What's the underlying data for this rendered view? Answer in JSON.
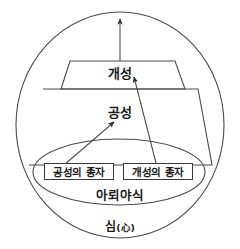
{
  "diagram": {
    "type": "concept-diagram",
    "outer_circle": {
      "name": "mind-circle",
      "label": "심(心)",
      "label_korean": "심",
      "label_hanja": "心"
    },
    "inner_ellipse": {
      "name": "alaya-consciousness-ellipse",
      "label": "아뢰야식"
    },
    "layers": [
      {
        "name": "upper-trapezoid",
        "label": "개성"
      },
      {
        "name": "lower-trapezoid",
        "label": "공성"
      }
    ],
    "seed_boxes": [
      {
        "name": "seed-box-gongseong",
        "label": "공성의 종자"
      },
      {
        "name": "seed-box-gaeseong",
        "label": "개성의 종자"
      }
    ],
    "arrows": [
      {
        "name": "arrow-seed-to-gongseong",
        "from": "공성의 종자",
        "to": "공성"
      },
      {
        "name": "arrow-seed-to-gaeseong",
        "from": "개성의 종자",
        "to": "개성"
      },
      {
        "name": "arrow-upward-outflow",
        "from": "개성",
        "to": ""
      }
    ],
    "colors": {
      "stroke": "#3a3a3a",
      "text": "#1a1a1a",
      "background": "#ffffff"
    }
  }
}
